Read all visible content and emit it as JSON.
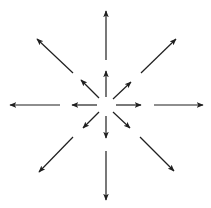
{
  "diagram": {
    "background": "#ffffff",
    "stroke_color": "#1f1f1f",
    "stroke_width": 1.2,
    "center": [
      106,
      105
    ],
    "arrows": [
      {
        "name": "inner-up",
        "from": [
          106,
          97
        ],
        "to": [
          106,
          71
        ]
      },
      {
        "name": "inner-down",
        "from": [
          106,
          116
        ],
        "to": [
          106,
          138
        ]
      },
      {
        "name": "inner-left",
        "from": [
          97,
          105
        ],
        "to": [
          72,
          105
        ]
      },
      {
        "name": "inner-right",
        "from": [
          116,
          105
        ],
        "to": [
          141,
          105
        ]
      },
      {
        "name": "inner-up-left",
        "from": [
          99,
          98
        ],
        "to": [
          81,
          80
        ]
      },
      {
        "name": "inner-up-right",
        "from": [
          113,
          99
        ],
        "to": [
          131,
          82
        ]
      },
      {
        "name": "inner-down-left",
        "from": [
          99,
          112
        ],
        "to": [
          83,
          128
        ]
      },
      {
        "name": "inner-down-right",
        "from": [
          113,
          112
        ],
        "to": [
          130,
          128
        ]
      },
      {
        "name": "outer-up",
        "from": [
          106,
          60
        ],
        "to": [
          106,
          11
        ]
      },
      {
        "name": "outer-down",
        "from": [
          106,
          151
        ],
        "to": [
          106,
          200
        ]
      },
      {
        "name": "outer-left",
        "from": [
          60,
          105
        ],
        "to": [
          10,
          105
        ]
      },
      {
        "name": "outer-right",
        "from": [
          154,
          105
        ],
        "to": [
          203,
          105
        ]
      },
      {
        "name": "outer-up-left",
        "from": [
          73,
          73
        ],
        "to": [
          37,
          39
        ]
      },
      {
        "name": "outer-up-right",
        "from": [
          141,
          73
        ],
        "to": [
          176,
          39
        ]
      },
      {
        "name": "outer-down-left",
        "from": [
          73,
          137
        ],
        "to": [
          39,
          172
        ]
      },
      {
        "name": "outer-down-right",
        "from": [
          140,
          137
        ],
        "to": [
          174,
          171
        ]
      }
    ]
  }
}
